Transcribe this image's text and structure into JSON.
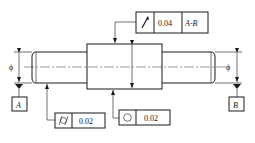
{
  "drawing": {
    "type": "shaft-gdt-drawing",
    "datums": {
      "left": "A",
      "right": "B"
    },
    "diameter_symbol": "ϕ",
    "feature_control_frames": [
      {
        "id": "top",
        "symbol": "circular-runout",
        "symbol_glyph": "↗",
        "tolerance": "0.04",
        "datum_ref": "A-B"
      },
      {
        "id": "bottom-left",
        "symbol": "cylindricity",
        "symbol_glyph": "⌭",
        "tolerance": "0.02"
      },
      {
        "id": "bottom-middle",
        "symbol": "circularity",
        "symbol_glyph": "○",
        "tolerance": "0.02"
      }
    ]
  }
}
